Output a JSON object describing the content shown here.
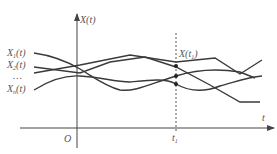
{
  "diagram": {
    "y_axis_label": "X(t)",
    "x_axis_label": "t",
    "origin_label": "O",
    "tick_label": "t",
    "tick_subscript": "1",
    "section_label": "X(t",
    "section_subscript": "1",
    "section_close": ")",
    "series_labels": [
      {
        "base": "X",
        "sub": "1",
        "suffix": "(t)"
      },
      {
        "base": "X",
        "sub": "2",
        "suffix": "(t)"
      },
      {
        "base": "…",
        "sub": "",
        "suffix": ""
      },
      {
        "base": "X",
        "sub": "n",
        "suffix": "(t)"
      }
    ],
    "colors": {
      "line": "#3a3a3a",
      "axis": "#444444",
      "text": "#555555"
    }
  }
}
